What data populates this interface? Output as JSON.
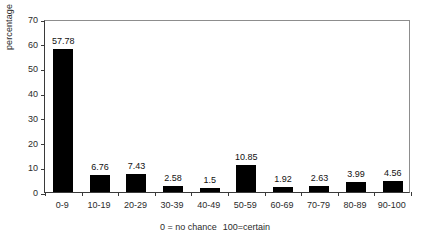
{
  "chart_data": {
    "type": "bar",
    "title": "",
    "subtitle": "",
    "xlabel": "",
    "ylabel": "percentage",
    "categories": [
      "0-9",
      "10-19",
      "20-29",
      "30-39",
      "40-49",
      "50-59",
      "60-69",
      "70-79",
      "80-89",
      "90-100"
    ],
    "values": [
      57.78,
      6.76,
      7.43,
      2.58,
      1.5,
      10.85,
      1.92,
      2.63,
      3.99,
      4.56
    ],
    "data_labels": [
      "57.78",
      "6.76",
      "7.43",
      "2.58",
      "1.5",
      "10.85",
      "1.92",
      "2.63",
      "3.99",
      "4.56"
    ],
    "ylim": [
      0,
      70
    ],
    "yticks": [
      0,
      10,
      20,
      30,
      40,
      50,
      60,
      70
    ],
    "ytick_labels": [
      "0",
      "10",
      "20",
      "30",
      "40",
      "50",
      "60",
      "70"
    ],
    "grid": false,
    "legend": false,
    "legend_position": "none",
    "bar_color": "#000000",
    "annotations": [
      {
        "text_left": "0 = no chance",
        "text_right": "100=certain"
      }
    ]
  },
  "axis": {
    "y_title": "percentage",
    "axis_color": "#3a3a3a",
    "frame_color": "#8d8d8d"
  },
  "caption": {
    "left": "0 = no chance",
    "right": "100=certain"
  }
}
